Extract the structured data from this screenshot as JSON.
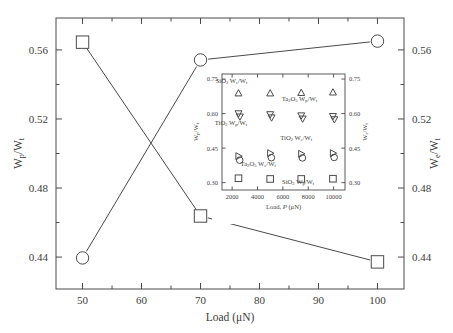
{
  "figure": {
    "title": "",
    "background": "#ffffff",
    "line_color": "#4a4a4a",
    "marker_color": "#4a4a4a"
  },
  "main_axes": {
    "xlabel_parts": {
      "text": "Load (",
      "unit": "μN",
      "close": ")"
    },
    "xlabel": "Load (μN)",
    "ylabel_left": "W_p/W_t",
    "ylabel_left_parts": {
      "w1": "W",
      "sub1": "p",
      "slash": "/",
      "w2": "W",
      "sub2": "t"
    },
    "ylabel_right": "W_e/W_t",
    "ylabel_right_parts": {
      "w1": "W",
      "sub1": "e",
      "slash": "/",
      "w2": "W",
      "sub2": "t"
    },
    "xticks": [
      "50",
      "60",
      "70",
      "80",
      "90",
      "100"
    ],
    "xtick_values": [
      50,
      60,
      70,
      80,
      90,
      100
    ],
    "yticks_left": [
      "0.44",
      "0.48",
      "0.52",
      "0.56"
    ],
    "ytick_values": [
      0.44,
      0.48,
      0.52,
      0.56
    ],
    "yticks_right": [
      "0.44",
      "0.48",
      "0.52",
      "0.56"
    ],
    "xlim": [
      45.5,
      104.5
    ],
    "ylim": [
      0.4215,
      0.5785
    ],
    "minor_ticks": true,
    "grid": false
  },
  "inset_axes": {
    "xlabel": "Load, P (μN)",
    "xlabel_parts": {
      "pre": "Load, ",
      "italic": "P",
      "unit": " (μN)"
    },
    "ylabel_left": "W_p/W_t",
    "ylabel_right": "W_e/W_t",
    "xticks": [
      "2000",
      "4000",
      "6000",
      "8000",
      "10000"
    ],
    "xtick_values": [
      2000,
      4000,
      6000,
      8000,
      10000
    ],
    "yticks": [
      "0.30",
      "0.45",
      "0.60",
      "0.75"
    ],
    "ytick_values": [
      0.3,
      0.45,
      0.6,
      0.75
    ],
    "xlim": [
      1200,
      10900
    ],
    "ylim": [
      0.268,
      0.772
    ],
    "grid": false,
    "annotations": [
      {
        "id": "sio2-we-wt",
        "text": "SiO2 We/Wt",
        "x": 1950,
        "y": 0.735
      },
      {
        "id": "ta2o5-wp-wt",
        "text": "Ta2O5 Wp/Wt",
        "x": 7300,
        "y": 0.655
      },
      {
        "id": "tio2-wp-wt",
        "text": "TiO2 Wp/Wt",
        "x": 1900,
        "y": 0.552
      },
      {
        "id": "tio2-we-wt",
        "text": "TiO2 We/Wt",
        "x": 7050,
        "y": 0.487
      },
      {
        "id": "ta2o5-we-wt",
        "text": "Ta2O5 We/Wt",
        "x": 4050,
        "y": 0.372
      },
      {
        "id": "sio2-wp-wt",
        "text": "SiO2 Wp/Wt",
        "x": 7200,
        "y": 0.294
      }
    ]
  },
  "chart_data": [
    {
      "id": "main-plot",
      "type": "line",
      "title": "",
      "xlabel": "Load (μN)",
      "ylabel": "W_p/W_t  (left),  W_e/W_t  (right)",
      "xlim": [
        45.5,
        104.5
      ],
      "ylim": [
        0.4215,
        0.5785
      ],
      "grid": false,
      "legend": "none",
      "x": [
        50,
        70,
        100
      ],
      "series": [
        {
          "name": "W_p/W_t",
          "marker": "square",
          "axis": "left",
          "values": [
            0.5645,
            0.4638,
            0.4372
          ]
        },
        {
          "name": "W_e/W_t",
          "marker": "circle",
          "axis": "right",
          "values": [
            0.4395,
            0.5542,
            0.5651
          ]
        }
      ]
    },
    {
      "id": "inset-plot",
      "type": "scatter",
      "title": "",
      "xlabel": "Load, P (μN)",
      "ylabel": "W_p/W_t  (left),  W_e/W_t  (right)",
      "xlim": [
        1200,
        10900
      ],
      "ylim": [
        0.268,
        0.772
      ],
      "grid": false,
      "legend": "annotations-inline",
      "x": [
        2500,
        5000,
        7450,
        9950
      ],
      "series": [
        {
          "name": "SiO2 W_e/W_t",
          "marker": "triangle-up",
          "values": [
            0.688,
            0.688,
            0.69,
            0.692
          ]
        },
        {
          "name": "TiO2 W_p/W_t",
          "marker": "triangle-down",
          "values": [
            0.601,
            0.597,
            0.592,
            0.589
          ]
        },
        {
          "name": "Ta2O5 W_p/W_t",
          "marker": "triangle-down-alt",
          "values": [
            0.601,
            0.597,
            0.592,
            0.589
          ]
        },
        {
          "name": "TiO2 W_e/W_t",
          "marker": "triangle-right",
          "values": [
            0.415,
            0.428,
            0.425,
            0.428
          ]
        },
        {
          "name": "Ta2O5 W_e/W_t",
          "marker": "circle",
          "values": [
            0.407,
            0.418,
            0.417,
            0.419
          ]
        },
        {
          "name": "SiO2 W_p/W_t",
          "marker": "square",
          "values": [
            0.319,
            0.316,
            0.316,
            0.317
          ]
        }
      ]
    }
  ]
}
